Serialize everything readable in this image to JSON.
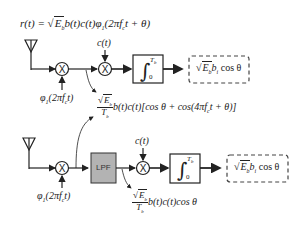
{
  "top_diagram": {
    "received_signal": "r(t) = √E_b b(t)c(t)φ_1(2πf_c t + θ)",
    "received_signal_parts": {
      "lhs": "r(t) = ",
      "sqrt": "E",
      "sub_b": "b",
      "rest": "b(t)c(t)φ",
      "sub_1": "1",
      "arg": "(2πf",
      "sub_c": "c",
      "tail": "t + θ)"
    },
    "carrier_input": "φ_1(2πf_c t)",
    "carrier_parts": {
      "phi": "φ",
      "sub": "1",
      "arg": "(2πf",
      "sub_c": "c",
      "tail": "t)"
    },
    "code_input": "c(t)",
    "integrator": {
      "upper": "T_b",
      "upper_main": "T",
      "upper_sub": "b",
      "lower": "0"
    },
    "output": "√E_b b_i cosθ",
    "output_parts": {
      "sqrt": "E",
      "sub_b": "b",
      "b": "b",
      "sub_i": "i",
      "tail": " cos θ"
    },
    "mixer_output": "√E_b / T_b · b(t)c(t)[cosθ + cos(4πf_c t + θ)]",
    "mixer_output_parts": {
      "num": "E",
      "num_sub": "b",
      "den": "T",
      "den_sub": "b",
      "body": "b(t)c(t)[cos θ + cos(4πf",
      "sub_c": "c",
      "tail": "t + θ)]"
    }
  },
  "bottom_diagram": {
    "carrier_input": "φ_1(2πf_c t)",
    "carrier_parts": {
      "phi": "φ",
      "sub": "1",
      "arg": "(2πf",
      "sub_c": "c",
      "tail": "t)"
    },
    "lpf_label": "LPF",
    "code_input": "c(t)",
    "integrator": {
      "upper_main": "T",
      "upper_sub": "b",
      "lower": "0"
    },
    "output_parts": {
      "sqrt": "E",
      "sub_b": "b",
      "b": "b",
      "sub_i": "i",
      "tail": " cos θ"
    },
    "lpf_output": "√E_b / T_b · b(t)c(t)cosθ",
    "lpf_output_parts": {
      "num": "E",
      "num_sub": "b",
      "den": "T",
      "den_sub": "b",
      "body": "b(t)c(t)cos θ"
    }
  },
  "symbols": {
    "multiply": "X",
    "integral": "∫"
  },
  "colors": {
    "line": "#222222",
    "lpf_fill": "#b3b3b3",
    "dashed": "#444444"
  }
}
